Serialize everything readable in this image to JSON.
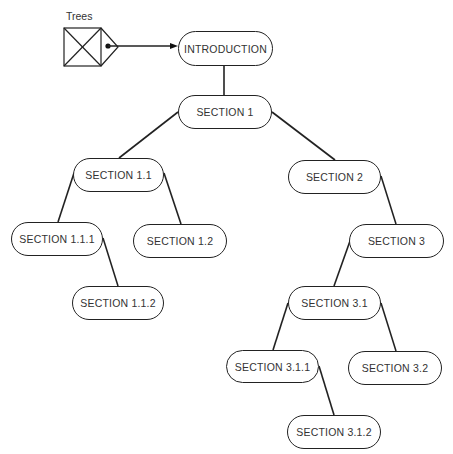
{
  "diagram": {
    "root_label": "Trees",
    "colors": {
      "line": "#222222",
      "text": "#333333",
      "background": "#ffffff"
    },
    "nodes": {
      "introduction": "INTRODUCTION",
      "section_1": "SECTION 1",
      "section_1_1": "SECTION 1.1",
      "section_1_1_1": "SECTION 1.1.1",
      "section_1_1_2": "SECTION 1.1.2",
      "section_1_2": "SECTION 1.2",
      "section_2": "SECTION 2",
      "section_3": "SECTION 3",
      "section_3_1": "SECTION 3.1",
      "section_3_1_1": "SECTION 3.1.1",
      "section_3_1_2": "SECTION 3.1.2",
      "section_3_2": "SECTION 3.2"
    },
    "edges": [
      [
        "trees",
        "introduction"
      ],
      [
        "introduction",
        "section_1"
      ],
      [
        "section_1",
        "section_1_1"
      ],
      [
        "section_1",
        "section_2"
      ],
      [
        "section_1_1",
        "section_1_1_1"
      ],
      [
        "section_1_1",
        "section_1_2"
      ],
      [
        "section_1_1_1",
        "section_1_1_2"
      ],
      [
        "section_2",
        "section_3"
      ],
      [
        "section_3",
        "section_3_1"
      ],
      [
        "section_3_1",
        "section_3_1_1"
      ],
      [
        "section_3_1",
        "section_3_2"
      ],
      [
        "section_3_1_1",
        "section_3_1_2"
      ]
    ]
  }
}
